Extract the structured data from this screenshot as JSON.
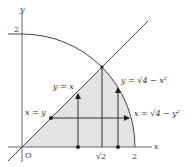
{
  "diagram": {
    "type": "region-of-integration",
    "axes": {
      "x_label": "x",
      "y_label": "y",
      "origin_label": "O"
    },
    "ticks": {
      "y_2": "2",
      "x_sqrt2": "√2",
      "x_2": "2"
    },
    "curves": {
      "line": "y = x",
      "line_alt": "x = y",
      "circle_upper": "y = √(4 − x²)",
      "circle_right": "x = √(4 − y²)"
    },
    "labels": {
      "y_eq_x": "y = x",
      "x_eq_y": "x = y",
      "y_eq_sqrt": "y = √4 − x²",
      "x_eq_sqrt": "x = √4 − y²"
    },
    "colors": {
      "shade": "#e3e3e3",
      "stroke": "#444444",
      "axis": "#666666"
    }
  }
}
